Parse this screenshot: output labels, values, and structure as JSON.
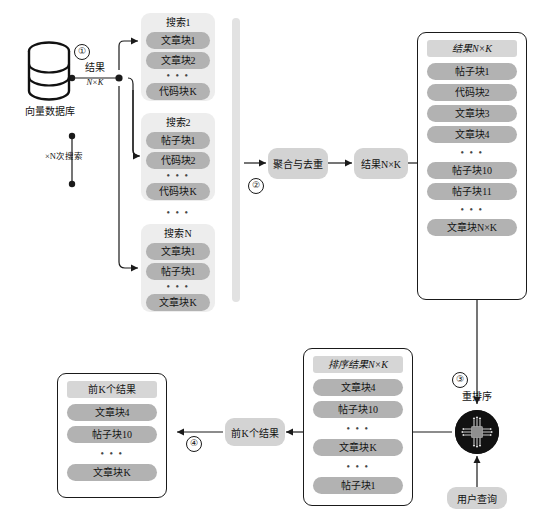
{
  "diagram": {
    "source": {
      "db_label": "向量数据库",
      "icon": "database-cylinder-icon",
      "result_label": "结果",
      "result_sub": "N×K",
      "repeat_label": "×N次搜索"
    },
    "steps": {
      "one": "①",
      "two": "②",
      "three": "③",
      "four": "④"
    },
    "search_groups": [
      {
        "header": "搜索1",
        "items": [
          "文章块1",
          "文章块2"
        ],
        "ellipsis": "• • •",
        "last": "代码块K"
      },
      {
        "header": "搜索2",
        "items": [
          "帖子块1",
          "代码块2"
        ],
        "ellipsis": "• • •",
        "last": "代码块K"
      },
      {
        "header": "搜索N",
        "items": [
          "文章块1",
          "帖子块1"
        ],
        "ellipsis": "• • •",
        "last": "文章块K"
      }
    ],
    "groups_gap_ellipsis": "• • •",
    "merge": {
      "label": "聚合与去重",
      "result_label": "结果N×K"
    },
    "merged_panel": {
      "header": "结果N×K",
      "rows": [
        {
          "type": "pill",
          "text": "帖子块1"
        },
        {
          "type": "pill",
          "text": "代码块2"
        },
        {
          "type": "pill",
          "text": "文章块3"
        },
        {
          "type": "pill",
          "text": "文章块4"
        },
        {
          "type": "ellipsis",
          "text": "• • •"
        },
        {
          "type": "pill",
          "text": "帖子块10"
        },
        {
          "type": "pill",
          "text": "帖子块11"
        },
        {
          "type": "ellipsis",
          "text": "• • •"
        },
        {
          "type": "pill",
          "text": "文章块N×K"
        }
      ]
    },
    "rerank": {
      "label": "重排序",
      "icon": "cpu-chip-icon",
      "query_label": "用户查询"
    },
    "sorted_panel": {
      "header": "排序结果N×K",
      "rows": [
        {
          "type": "pill",
          "text": "文章块4"
        },
        {
          "type": "pill",
          "text": "帖子块10"
        },
        {
          "type": "ellipsis",
          "text": "• • •"
        },
        {
          "type": "pill",
          "text": "文章块K"
        },
        {
          "type": "ellipsis",
          "text": "• • •"
        },
        {
          "type": "pill",
          "text": "帖子块1"
        }
      ]
    },
    "topk_transfer": {
      "label": "前K个结果"
    },
    "topk_panel": {
      "header": "前K个结果",
      "rows": [
        {
          "type": "pill",
          "text": "文章块4"
        },
        {
          "type": "pill",
          "text": "帖子块10"
        },
        {
          "type": "ellipsis",
          "text": "• • •"
        },
        {
          "type": "pill",
          "text": "文章块K"
        }
      ]
    },
    "colors": {
      "pill": "#b2b2b2",
      "panel_head": "#d6d6d6",
      "group_card": "#ededed",
      "proc_box": "#d3d3d3",
      "line": "#1a1a1a",
      "chip": "#111111"
    }
  }
}
